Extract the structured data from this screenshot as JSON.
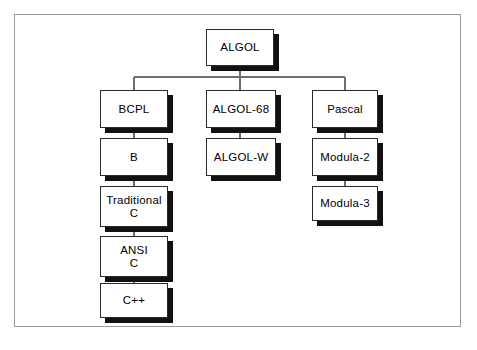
{
  "diagram": {
    "type": "tree-diagram",
    "frame": {
      "name": "scan-border"
    },
    "colors": {
      "background": "#ffffff",
      "box_fill": "#ffffff",
      "box_border": "#2b2b2b",
      "box_shadow": "#111111",
      "connector": "#6f6f6f",
      "frame_border": "#9a9a9a",
      "text": "#000000"
    },
    "root": {
      "id": "algol",
      "label": "ALGOL",
      "x": 206,
      "y": 29,
      "w": 68,
      "h": 37
    },
    "columns": [
      {
        "id": "bcpl-branch",
        "name": "left-branch",
        "nodes": [
          {
            "id": "bcpl",
            "label": "BCPL",
            "x": 100,
            "y": 90,
            "w": 68,
            "h": 38
          },
          {
            "id": "b",
            "label": "B",
            "x": 100,
            "y": 138,
            "w": 68,
            "h": 38
          },
          {
            "id": "traditional-c",
            "label": "Traditional\nC",
            "x": 100,
            "y": 186,
            "w": 68,
            "h": 41
          },
          {
            "id": "ansi-c",
            "label": "ANSI\nC",
            "x": 100,
            "y": 236,
            "w": 68,
            "h": 41
          },
          {
            "id": "cpp",
            "label": "C++",
            "x": 100,
            "y": 283,
            "w": 68,
            "h": 35
          }
        ]
      },
      {
        "id": "algol68-branch",
        "name": "middle-branch",
        "nodes": [
          {
            "id": "algol-68",
            "label": "ALGOL-68",
            "x": 206,
            "y": 90,
            "w": 70,
            "h": 38
          },
          {
            "id": "algol-w",
            "label": "ALGOL-W",
            "x": 206,
            "y": 138,
            "w": 70,
            "h": 38
          }
        ]
      },
      {
        "id": "pascal-branch",
        "name": "right-branch",
        "nodes": [
          {
            "id": "pascal",
            "label": "Pascal",
            "x": 312,
            "y": 90,
            "w": 66,
            "h": 38
          },
          {
            "id": "modula-2",
            "label": "Modula-2",
            "x": 312,
            "y": 138,
            "w": 66,
            "h": 38
          },
          {
            "id": "modula-3",
            "label": "Modula-3",
            "x": 312,
            "y": 186,
            "w": 66,
            "h": 35
          }
        ]
      }
    ],
    "edges": [
      {
        "from": "algol",
        "to": "bus",
        "kind": "vertical"
      },
      {
        "from": "bus",
        "to": "bcpl",
        "kind": "elbow"
      },
      {
        "from": "bus",
        "to": "algol-68",
        "kind": "vertical"
      },
      {
        "from": "bus",
        "to": "pascal",
        "kind": "elbow"
      },
      {
        "from": "bcpl",
        "to": "b",
        "kind": "vertical"
      },
      {
        "from": "b",
        "to": "traditional-c",
        "kind": "vertical"
      },
      {
        "from": "traditional-c",
        "to": "ansi-c",
        "kind": "vertical"
      },
      {
        "from": "ansi-c",
        "to": "cpp",
        "kind": "vertical"
      },
      {
        "from": "algol-68",
        "to": "algol-w",
        "kind": "vertical"
      },
      {
        "from": "pascal",
        "to": "modula-2",
        "kind": "vertical"
      },
      {
        "from": "modula-2",
        "to": "modula-3",
        "kind": "vertical"
      }
    ],
    "bus": {
      "y": 77,
      "x1": 134,
      "x2": 345
    }
  }
}
